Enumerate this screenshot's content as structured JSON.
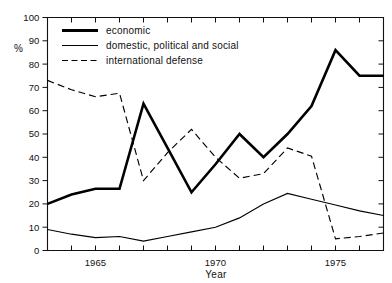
{
  "chart_data": {
    "type": "line",
    "title": "",
    "xlabel": "Year",
    "ylabel": "%",
    "xlim": [
      1963,
      1977
    ],
    "ylim": [
      0,
      100
    ],
    "grid": false,
    "legend_position": "top-left-inside",
    "x": [
      1963,
      1964,
      1965,
      1966,
      1967,
      1968,
      1969,
      1970,
      1971,
      1972,
      1973,
      1974,
      1975,
      1976,
      1977
    ],
    "xticks": [
      1963,
      1964,
      1965,
      1966,
      1967,
      1968,
      1969,
      1970,
      1971,
      1972,
      1973,
      1974,
      1975,
      1976,
      1977
    ],
    "xtick_labels": [
      "",
      "",
      "1965",
      "",
      "",
      "",
      "",
      "1970",
      "",
      "",
      "",
      "",
      "1975",
      "",
      ""
    ],
    "yticks": [
      0,
      10,
      20,
      30,
      40,
      50,
      60,
      70,
      80,
      90,
      100
    ],
    "ytick_labels": [
      "0",
      "10",
      "20",
      "30",
      "40",
      "50",
      "60",
      "70",
      "80",
      "90",
      "100"
    ],
    "series": [
      {
        "name": "economic",
        "style": "thick-solid",
        "values": [
          20,
          24,
          26.5,
          26.5,
          63,
          44,
          25,
          37,
          50,
          40,
          50,
          62,
          86,
          75,
          75
        ]
      },
      {
        "name": "domestic, political and social",
        "style": "thin-solid",
        "values": [
          9,
          7,
          5.5,
          6,
          4,
          6,
          8,
          10,
          14,
          20,
          24.5,
          22,
          19.5,
          17,
          15
        ]
      },
      {
        "name": "international defense",
        "style": "dashed",
        "values": [
          73,
          69,
          66,
          67.5,
          30,
          42,
          52,
          40,
          31,
          33,
          44,
          40.5,
          5,
          6,
          7.5
        ]
      }
    ]
  },
  "legend": {
    "items": [
      {
        "label": "economic",
        "style": "thick-solid"
      },
      {
        "label": "domestic, political and social",
        "style": "thin-solid"
      },
      {
        "label": "international defense",
        "style": "dashed"
      }
    ]
  },
  "axes": {
    "y_unit": "%",
    "x_title": "Year"
  }
}
